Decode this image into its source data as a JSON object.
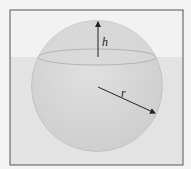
{
  "diagram": {
    "labels": {
      "height": "h",
      "radius": "r"
    },
    "colors": {
      "background": "#f4f4f4",
      "air": "#f1f1f1",
      "water": "#e2e2e2",
      "sphere_fill": "#d6d6d6",
      "frame": "#555555",
      "arrow": "#222222"
    }
  }
}
